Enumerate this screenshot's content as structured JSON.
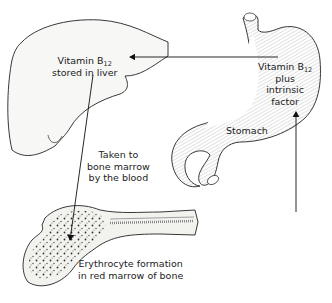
{
  "diagram": {
    "labels": {
      "liver": {
        "line1_prefix": "Vitamin B",
        "line1_sub": "12",
        "line2": "stored in liver"
      },
      "stomach_content": {
        "line1_prefix": "Vitamin B",
        "line1_sub": "12",
        "line2": "plus",
        "line3": "intrinsic",
        "line4": "factor"
      },
      "stomach": "Stomach",
      "transport": {
        "line1": "Taken to",
        "line2": "bone marrow",
        "line3": "by the blood"
      },
      "bone": {
        "line1": "Erythrocyte formation",
        "line2": "in red marrow of bone"
      }
    },
    "organs": [
      "liver",
      "stomach",
      "bone"
    ],
    "arrows": [
      {
        "from": "stomach",
        "to": "liver"
      },
      {
        "from": "intake",
        "to": "stomach"
      },
      {
        "from": "liver",
        "to": "bone marrow"
      }
    ],
    "colors": {
      "line": "#222222",
      "fill": "#f7f7f5",
      "background": "#ffffff"
    }
  }
}
